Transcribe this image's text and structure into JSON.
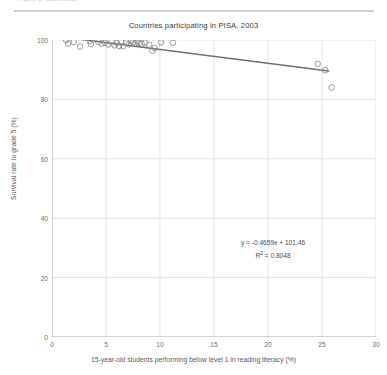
{
  "top_caption": "Figure 1.  (continued)",
  "chart_data": {
    "type": "scatter",
    "title": "Countries participating in PISA, 2003",
    "xlabel": "15-year-old students performing below level 1 in reading literacy (%)",
    "ylabel": "Survival rate to grade 5 (%)",
    "xlim": [
      0,
      30
    ],
    "ylim": [
      0,
      100
    ],
    "xticks": [
      0,
      5,
      10,
      15,
      20,
      25,
      30
    ],
    "yticks": [
      0,
      20,
      40,
      60,
      80,
      100
    ],
    "grid": true,
    "legend": "none",
    "marker": "open-circle",
    "marker_color": "#8d8d8d",
    "trendline_color": "#6f6f6f",
    "gridline_color": "#d8d8d8",
    "points": [
      {
        "x": 1.3,
        "y": 100.0
      },
      {
        "x": 1.5,
        "y": 98.8
      },
      {
        "x": 2.0,
        "y": 99.3
      },
      {
        "x": 2.6,
        "y": 97.8
      },
      {
        "x": 3.5,
        "y": 99.6
      },
      {
        "x": 3.6,
        "y": 98.6
      },
      {
        "x": 4.3,
        "y": 99.3
      },
      {
        "x": 4.6,
        "y": 98.8
      },
      {
        "x": 4.9,
        "y": 99.1
      },
      {
        "x": 5.2,
        "y": 98.5
      },
      {
        "x": 5.5,
        "y": 99.4
      },
      {
        "x": 5.8,
        "y": 98.2
      },
      {
        "x": 6.0,
        "y": 99.0
      },
      {
        "x": 6.2,
        "y": 98.0
      },
      {
        "x": 6.4,
        "y": 99.5
      },
      {
        "x": 6.6,
        "y": 97.9
      },
      {
        "x": 6.9,
        "y": 99.2
      },
      {
        "x": 7.1,
        "y": 98.6
      },
      {
        "x": 7.3,
        "y": 99.6
      },
      {
        "x": 7.5,
        "y": 99.2
      },
      {
        "x": 7.7,
        "y": 98.9
      },
      {
        "x": 7.9,
        "y": 99.4
      },
      {
        "x": 8.1,
        "y": 99.0
      },
      {
        "x": 8.3,
        "y": 98.7
      },
      {
        "x": 8.6,
        "y": 99.1
      },
      {
        "x": 9.0,
        "y": 98.4
      },
      {
        "x": 9.3,
        "y": 96.4
      },
      {
        "x": 9.5,
        "y": 97.3
      },
      {
        "x": 10.1,
        "y": 99.2
      },
      {
        "x": 11.2,
        "y": 99.1
      },
      {
        "x": 24.6,
        "y": 92.0
      },
      {
        "x": 25.3,
        "y": 89.8
      },
      {
        "x": 25.9,
        "y": 84.0
      }
    ],
    "trendline": {
      "slope": -0.4659,
      "intercept": 101.46,
      "x_start": 0.9,
      "x_end": 25.6
    },
    "annotation": {
      "equation_prefix": "y = -0.4659x + 101.46",
      "r2_label": "R",
      "r2_sup": "2",
      "r2_value": " = 0.8048"
    }
  }
}
